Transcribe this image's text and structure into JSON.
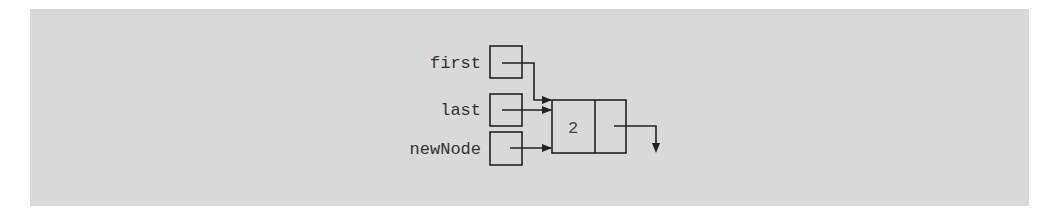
{
  "diagram": {
    "type": "linked-list-pointer-diagram",
    "background_color": "#d9d9d9",
    "line_color": "#222222",
    "pointers": [
      {
        "label": "first",
        "points_to": "node_1"
      },
      {
        "label": "last",
        "points_to": "node_1"
      },
      {
        "label": "newNode",
        "points_to": "node_1"
      }
    ],
    "nodes": [
      {
        "id": "node_1",
        "info": "2",
        "link": "null"
      }
    ]
  }
}
